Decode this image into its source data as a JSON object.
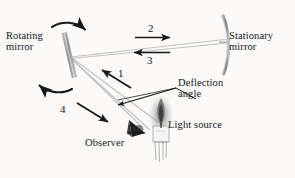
{
  "figure": {
    "background_color": "#fbfaf8",
    "ink_color": "#171717",
    "ray_color": "#bdbdbd",
    "mirror_color": "#9a9a9a",
    "width": 295,
    "height": 178
  },
  "labels": {
    "rotating_mirror": "Rotating\nmirror",
    "stationary_mirror": "Stationary\nmirror",
    "deflection_angle": "Deflection\nangle",
    "light_source": "Light source",
    "observer": "Observer"
  },
  "ray_numbers": {
    "one": "1",
    "two": "2",
    "three": "3",
    "four": "4"
  },
  "elements": {
    "rotating_mirror_icon": "tilted-bar-mirror",
    "stationary_mirror_icon": "curved-arc-mirror",
    "observer_icon": "eye-cone",
    "light_source_icon": "candle-flame",
    "rotation_arrow_top": "curved-arrow-clockwise",
    "rotation_arrow_bottom": "curved-arrow-counterclockwise",
    "arrow_two_direction": "right",
    "arrow_three_direction": "left",
    "arrow_one_direction": "up-left",
    "arrow_four_direction": "down-right",
    "deflection_leader": "leader-line"
  }
}
